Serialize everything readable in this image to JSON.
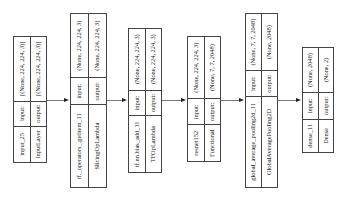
{
  "diagram": {
    "type": "keras_model_plot",
    "orientation": "left-to-right (rotated)",
    "nodes": [
      {
        "name": "input_25",
        "layer_type": "InputLayer",
        "input_label": "input:",
        "output_label": "output:",
        "input_shape": "[(None, 224, 224, 3)]",
        "output_shape": "[(None, 224, 224, 3)]"
      },
      {
        "name": "tf._operators_.getitem_11",
        "layer_type": "SlicingOpLambda",
        "input_label": "input:",
        "output_label": "output:",
        "input_shape": "(None, 224, 224, 3)",
        "output_shape": "(None, 224, 224, 3)"
      },
      {
        "name": "tf.nn.bias_add_11",
        "layer_type": "TFOpLambda",
        "input_label": "input:",
        "output_label": "output:",
        "input_shape": "(None, 224, 224, 3)",
        "output_shape": "(None, 224, 224, 3)"
      },
      {
        "name": "resnet152",
        "layer_type": "Functional",
        "input_label": "input:",
        "output_label": "output:",
        "input_shape": "(None, 224, 224, 3)",
        "output_shape": "(None, 7, 7, 2048)"
      },
      {
        "name": "global_average_pooling2d_11",
        "layer_type": "GlobalAveragePooling2D",
        "input_label": "input:",
        "output_label": "output:",
        "input_shape": "(None, 7, 7, 2048)",
        "output_shape": "(None, 2048)"
      },
      {
        "name": "dense_11",
        "layer_type": "Dense",
        "input_label": "input:",
        "output_label": "output:",
        "input_shape": "(None, 2048)",
        "output_shape": "(None, 2)"
      }
    ],
    "edges": [
      {
        "from": "input_25",
        "to": "tf._operators_.getitem_11"
      },
      {
        "from": "tf._operators_.getitem_11",
        "to": "tf.nn.bias_add_11"
      },
      {
        "from": "tf.nn.bias_add_11",
        "to": "resnet152"
      },
      {
        "from": "resnet152",
        "to": "global_average_pooling2d_11"
      },
      {
        "from": "global_average_pooling2d_11",
        "to": "dense_11"
      }
    ]
  }
}
